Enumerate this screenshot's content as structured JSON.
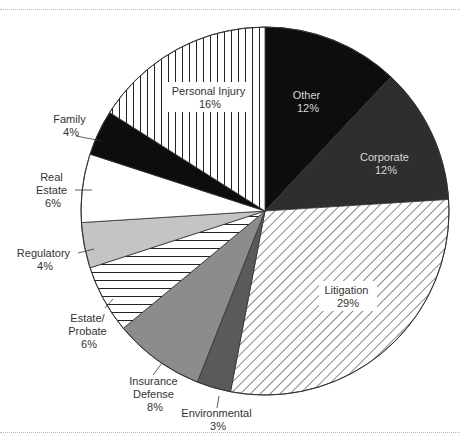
{
  "chart_data": {
    "type": "pie",
    "title": "",
    "start_angle_deg": 0,
    "direction": "clockwise",
    "slices": [
      {
        "label": "Other",
        "value": 12,
        "pct_label": "12%",
        "fill": "#0d0d0d",
        "pattern": "solid",
        "text_color": "#d8d8d8",
        "label_inside": true
      },
      {
        "label": "Corporate",
        "value": 12,
        "pct_label": "12%",
        "fill": "#2e2e2e",
        "pattern": "solid",
        "text_color": "#d8d8d8",
        "label_inside": true
      },
      {
        "label": "Litigation",
        "value": 29,
        "pct_label": "29%",
        "fill": "#ffffff",
        "pattern": "diagonal",
        "text_color": "#333333",
        "label_inside": true
      },
      {
        "label": "Environmental",
        "value": 3,
        "pct_label": "3%",
        "fill": "#5a5a5a",
        "pattern": "solid",
        "text_color": "#333333",
        "label_inside": false
      },
      {
        "label": "Insurance Defense",
        "value": 8,
        "pct_label": "8%",
        "fill": "#8c8c8c",
        "pattern": "solid",
        "text_color": "#333333",
        "label_inside": false
      },
      {
        "label": "Estate/ Probate",
        "value": 6,
        "pct_label": "6%",
        "fill": "#ffffff",
        "pattern": "horizontal",
        "text_color": "#333333",
        "label_inside": false
      },
      {
        "label": "Regulatory",
        "value": 4,
        "pct_label": "4%",
        "fill": "#c4c4c4",
        "pattern": "solid",
        "text_color": "#333333",
        "label_inside": false
      },
      {
        "label": "Real Estate",
        "value": 6,
        "pct_label": "6%",
        "fill": "#ffffff",
        "pattern": "solid",
        "text_color": "#333333",
        "label_inside": false
      },
      {
        "label": "Family",
        "value": 4,
        "pct_label": "4%",
        "fill": "#0d0d0d",
        "pattern": "solid",
        "text_color": "#333333",
        "label_inside": false
      },
      {
        "label": "Personal Injury",
        "value": 16,
        "pct_label": "16%",
        "fill": "#ffffff",
        "pattern": "vertical",
        "text_color": "#333333",
        "label_inside": true
      }
    ],
    "labels": {
      "other": {
        "line1": "Other",
        "line2": "12%"
      },
      "corporate": {
        "line1": "Corporate",
        "line2": "12%"
      },
      "litigation": {
        "line1": "Litigation",
        "line2": "29%"
      },
      "environmental": {
        "line1": "Environmental",
        "line2": "3%"
      },
      "insurance": {
        "line1": "Insurance",
        "line2": "Defense",
        "line3": "8%"
      },
      "estate": {
        "line1": "Estate/",
        "line2": "Probate",
        "line3": "6%"
      },
      "regulatory": {
        "line1": "Regulatory",
        "line2": "4%"
      },
      "realestate": {
        "line1": "Real",
        "line2": "Estate",
        "line3": "6%"
      },
      "family": {
        "line1": "Family",
        "line2": "4%"
      },
      "personal": {
        "line1": "Personal Injury",
        "line2": "16%"
      }
    },
    "legend": "none",
    "center": [
      265,
      211
    ],
    "radius": 184
  }
}
